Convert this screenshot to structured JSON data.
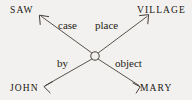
{
  "diagram": {
    "background_color": "#f3f1ef",
    "stroke_color": "#3a352e",
    "hub": {
      "label": "",
      "shape": "open-circle",
      "cx": 95,
      "cy": 56,
      "r": 4.2
    },
    "nodes": [
      {
        "id": "saw",
        "label": "SAW",
        "position": "top-left"
      },
      {
        "id": "village",
        "label": "VILLAGE",
        "position": "top-right"
      },
      {
        "id": "john",
        "label": "JOHN",
        "position": "bottom-left"
      },
      {
        "id": "mary",
        "label": "MARY",
        "position": "bottom-right"
      }
    ],
    "edges": [
      {
        "id": "case",
        "label": "case",
        "from": "hub",
        "to": "saw",
        "direction": "up-left"
      },
      {
        "id": "place",
        "label": "place",
        "from": "hub",
        "to": "village",
        "direction": "up-right"
      },
      {
        "id": "by",
        "label": "by",
        "from": "hub",
        "to": "john",
        "direction": "down-left"
      },
      {
        "id": "object",
        "label": "object",
        "from": "hub",
        "to": "mary",
        "direction": "down-right"
      }
    ]
  }
}
